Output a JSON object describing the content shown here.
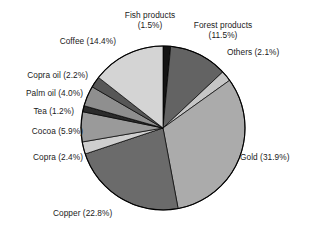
{
  "chart_data": {
    "type": "pie",
    "title": "",
    "subtitle": "",
    "xlabel": "",
    "ylabel": "",
    "legend_position": "none",
    "grid": false,
    "labels_show_percent": true,
    "total_percent": 99.9,
    "start_angle_deg": 0,
    "direction": "clockwise",
    "categories": [
      "Fish products",
      "Forest products",
      "Others",
      "Gold",
      "Copper",
      "Copra",
      "Cocoa",
      "Tea",
      "Palm oil",
      "Copra oil",
      "Coffee"
    ],
    "values": [
      1.5,
      11.5,
      2.1,
      31.9,
      22.8,
      2.4,
      5.9,
      1.2,
      4.0,
      2.2,
      14.4
    ],
    "colors": [
      "#141414",
      "#636363",
      "#c6c6c6",
      "#ababab",
      "#6b6b6b",
      "#cfcfcf",
      "#9a9a9a",
      "#2b2b2b",
      "#8f8f8f",
      "#575757",
      "#d4d4d4"
    ],
    "slices": [
      {
        "name": "Fish products",
        "percent": 1.5,
        "label": "Fish products\n(1.5%)",
        "color": "#141414"
      },
      {
        "name": "Forest products",
        "percent": 11.5,
        "label": "Forest products\n(11.5%)",
        "color": "#636363"
      },
      {
        "name": "Others",
        "percent": 2.1,
        "label": "Others (2.1%)",
        "color": "#c6c6c6"
      },
      {
        "name": "Gold",
        "percent": 31.9,
        "label": "Gold (31.9%)",
        "color": "#ababab"
      },
      {
        "name": "Copper",
        "percent": 22.8,
        "label": "Copper (22.8%)",
        "color": "#6b6b6b"
      },
      {
        "name": "Copra",
        "percent": 2.4,
        "label": "Copra (2.4%)",
        "color": "#cfcfcf"
      },
      {
        "name": "Cocoa",
        "percent": 5.9,
        "label": "Cocoa (5.9%)",
        "color": "#9a9a9a"
      },
      {
        "name": "Tea",
        "percent": 1.2,
        "label": "Tea (1.2%)",
        "color": "#2b2b2b"
      },
      {
        "name": "Palm oil",
        "percent": 4.0,
        "label": "Palm oil (4.0%)",
        "color": "#8f8f8f"
      },
      {
        "name": "Copra oil",
        "percent": 2.2,
        "label": "Copra oil (2.2%)",
        "color": "#575757"
      },
      {
        "name": "Coffee",
        "percent": 14.4,
        "label": "Coffee (14.4%)",
        "color": "#d4d4d4"
      }
    ]
  },
  "labels": {
    "fish_products": "Fish products\n(1.5%)",
    "forest_products": "Forest products\n(11.5%)",
    "others": "Others (2.1%)",
    "gold": "Gold (31.9%)",
    "copper": "Copper (22.8%)",
    "copra": "Copra (2.4%)",
    "cocoa": "Cocoa (5.9%)",
    "tea": "Tea (1.2%)",
    "palm_oil": "Palm oil (4.0%)",
    "copra_oil": "Copra oil (2.2%)",
    "coffee": "Coffee (14.4%)"
  },
  "geometry": {
    "center_x": 163,
    "center_y": 128,
    "radius": 82,
    "outline_color": "#000000"
  }
}
